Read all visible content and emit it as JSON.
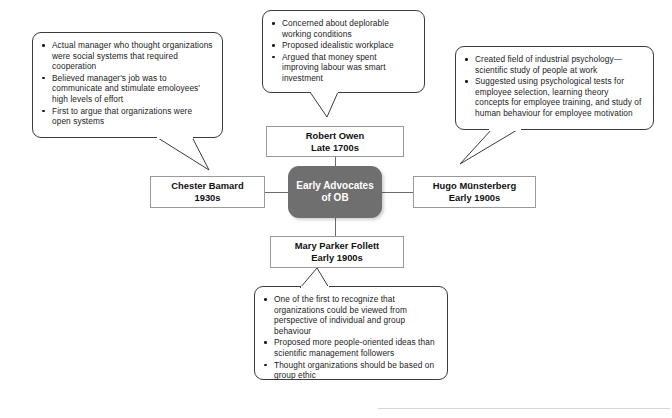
{
  "diagram": {
    "title": "Early Advocates of OB",
    "type": "hub-and-spoke mind map",
    "center": {
      "line1": "Early Advocates",
      "line2": "of OB",
      "fill_color": "#6f6f6f",
      "text_color": "#ffffff"
    },
    "branches": [
      {
        "id": "robert-owen",
        "position": "top",
        "name": "Robert Owen",
        "period": "Late 1700s",
        "bullets": [
          "Concerned about deplorable working conditions",
          "Proposed idealistic workplace",
          "Argued that money spent improving labour was smart investment"
        ]
      },
      {
        "id": "chester-barnard",
        "position": "left",
        "name": "Chester Bamard",
        "period": "1930s",
        "bullets": [
          "Actual manager who thought organizations were social systems that required cooperation",
          "Believed manager's job was to communicate and stimulate emoloyees' high levels of effort",
          "First to argue that organizations were open systems"
        ]
      },
      {
        "id": "hugo-munsterberg",
        "position": "right",
        "name": "Hugo Münsterberg",
        "period": "Early 1900s",
        "bullets": [
          "Created field of industrial psychology—scientific study of people at work",
          "Suggested using psychological tests for employee selection, learning theory concepts for employee training, and study of human behaviour for employee motivation"
        ]
      },
      {
        "id": "mary-parker-follett",
        "position": "bottom",
        "name": "Mary Parker Follett",
        "period": "Early 1900s",
        "bullets": [
          "One of the first to recognize that organizations could be viewed from perspective of individual and group behaviour",
          "Proposed more people-oriented ideas than scientific management followers",
          "Thought organizations should be based on group ethic"
        ]
      }
    ]
  }
}
